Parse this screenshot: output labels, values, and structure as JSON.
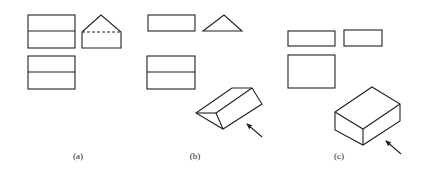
{
  "figure": {
    "panels": [
      {
        "id": "a",
        "caption": "(a)",
        "description": "Three-view drawing: front view, side view (pentagon with hidden dashed line), top view"
      },
      {
        "id": "b",
        "caption": "(b)",
        "description": "Three-view drawing of triangular prism with isometric view and viewing-direction arrow"
      },
      {
        "id": "c",
        "caption": "(c)",
        "description": "Three-view drawing of rectangular box with isometric view and viewing-direction arrow"
      }
    ],
    "colors": {
      "line": "#222222",
      "background": "#ffffff"
    }
  }
}
